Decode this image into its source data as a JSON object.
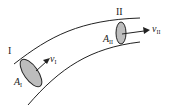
{
  "diagram": {
    "type": "curved flow tube with two cross-sections",
    "sections": [
      {
        "roman": "I",
        "area_symbol": "A",
        "area_sub": "I",
        "velocity_symbol": "v",
        "velocity_sub": "I"
      },
      {
        "roman": "II",
        "area_symbol": "A",
        "area_sub": "II",
        "velocity_symbol": "v",
        "velocity_sub": "II"
      }
    ],
    "colors": {
      "line": "#222222",
      "fill": "#bdbdbd"
    }
  }
}
